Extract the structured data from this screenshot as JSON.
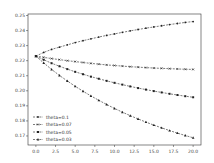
{
  "chart_data": {
    "type": "line",
    "title": "",
    "xlabel": "",
    "ylabel": "",
    "xlim": [
      -1,
      21
    ],
    "ylim": [
      0.164,
      0.251
    ],
    "grid": false,
    "legend_position": "lower left",
    "x_ticks": [
      "0.0",
      "2.5",
      "5.0",
      "7.5",
      "10.0",
      "12.5",
      "15.0",
      "17.5",
      "20.0"
    ],
    "y_ticks": [
      "0.17",
      "0.18",
      "0.19",
      "0.20",
      "0.21",
      "0.22",
      "0.23",
      "0.24",
      "0.25"
    ],
    "x": [
      0,
      1,
      2,
      3,
      4,
      5,
      6,
      7,
      8,
      9,
      10,
      11,
      12,
      13,
      14,
      15,
      16,
      17,
      18,
      19,
      20
    ],
    "series": [
      {
        "name": "theta=0.1",
        "marker": "dot",
        "values": [
          0.223,
          0.2255,
          0.2275,
          0.229,
          0.2305,
          0.232,
          0.2333,
          0.2345,
          0.2357,
          0.2368,
          0.2378,
          0.2388,
          0.2398,
          0.2407,
          0.2416,
          0.2424,
          0.2432,
          0.244,
          0.2447,
          0.2454,
          0.246
        ]
      },
      {
        "name": "theta=0.07",
        "marker": "x",
        "values": [
          0.223,
          0.2222,
          0.2214,
          0.2207,
          0.22,
          0.2194,
          0.2188,
          0.2182,
          0.2177,
          0.2172,
          0.2168,
          0.2164,
          0.216,
          0.2157,
          0.2154,
          0.2151,
          0.2149,
          0.2147,
          0.2145,
          0.2143,
          0.2142
        ]
      },
      {
        "name": "theta=0.05",
        "marker": "square",
        "values": [
          0.223,
          0.2206,
          0.2183,
          0.2163,
          0.2144,
          0.2126,
          0.211,
          0.2094,
          0.208,
          0.2066,
          0.2053,
          0.2041,
          0.2029,
          0.2018,
          0.2008,
          0.1998,
          0.1989,
          0.198,
          0.1972,
          0.1964,
          0.1957
        ]
      },
      {
        "name": "theta=0.03",
        "marker": "triangle",
        "values": [
          0.223,
          0.2185,
          0.2142,
          0.2102,
          0.2065,
          0.203,
          0.1997,
          0.1966,
          0.1937,
          0.1909,
          0.1883,
          0.1858,
          0.1835,
          0.1813,
          0.1792,
          0.1772,
          0.1754,
          0.1736,
          0.1719,
          0.1703,
          0.1688
        ]
      }
    ]
  }
}
